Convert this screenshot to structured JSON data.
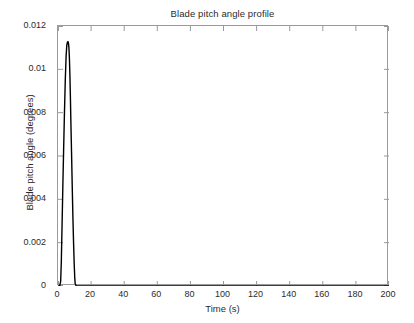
{
  "chart_data": {
    "type": "line",
    "title": "Blade pitch angle profile",
    "xlabel": "Time (s)",
    "ylabel": "Blade pitch angle (degrees)",
    "xlim": [
      0,
      200
    ],
    "ylim": [
      0,
      0.012
    ],
    "grid": false,
    "legend": null,
    "line_color": "#000000",
    "axes_color": "#9a9a9a",
    "background": "#ffffff",
    "xticks": [
      0,
      20,
      40,
      60,
      80,
      100,
      120,
      140,
      160,
      180,
      200
    ],
    "xtick_labels": [
      "0",
      "20",
      "40",
      "60",
      "80",
      "100",
      "120",
      "140",
      "160",
      "180",
      "200"
    ],
    "yticks": [
      0,
      0.002,
      0.004,
      0.006,
      0.008,
      0.01,
      0.012
    ],
    "ytick_labels": [
      "0",
      "0.002",
      "0.004",
      "0.006",
      "0.008",
      "0.01",
      "0.012"
    ],
    "series": [
      {
        "name": "Blade pitch angle",
        "x": [
          0,
          1.0,
          1.6,
          2.0,
          2.4,
          2.9,
          3.4,
          3.9,
          4.4,
          4.9,
          5.3,
          5.7,
          6.0,
          6.3,
          6.6,
          6.9,
          7.2,
          7.5,
          7.8,
          8.2,
          8.6,
          9.0,
          9.4,
          9.8,
          10.1,
          10.4,
          11.0,
          12.0,
          20,
          40,
          60,
          80,
          100,
          120,
          140,
          160,
          180,
          200
        ],
        "y": [
          0,
          0,
          0.0002,
          0.0011,
          0.0026,
          0.0045,
          0.0063,
          0.008,
          0.0095,
          0.0106,
          0.0111,
          0.01125,
          0.01128,
          0.01122,
          0.011,
          0.0105,
          0.0097,
          0.0087,
          0.0075,
          0.0061,
          0.0046,
          0.0032,
          0.002,
          0.001,
          0.0004,
          0.0001,
          0,
          0,
          0,
          0,
          0,
          0,
          0,
          0,
          0,
          0,
          0,
          0
        ]
      }
    ],
    "peak": {
      "x": 6.0,
      "y": 0.0113
    }
  }
}
